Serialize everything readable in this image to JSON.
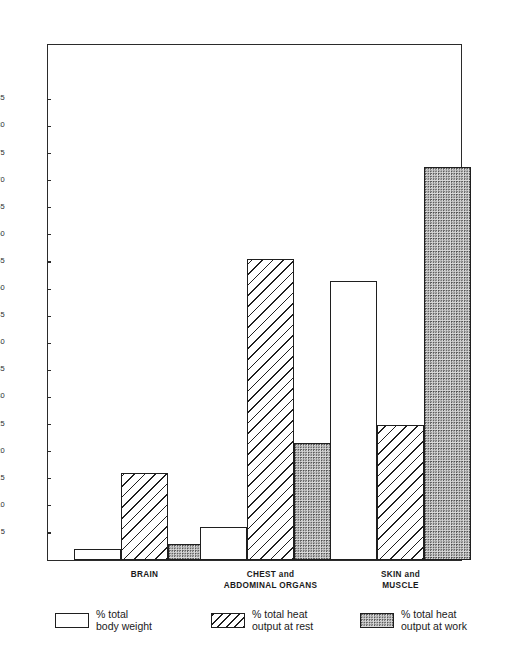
{
  "chart_data": {
    "type": "bar",
    "title": "",
    "subtitle": "",
    "xlabel": "",
    "ylabel": "",
    "grid": false,
    "legend_position": "bottom",
    "ylim": [
      0,
      88
    ],
    "yticks": [
      5,
      10,
      15,
      20,
      25,
      30,
      35,
      40,
      45,
      50,
      55,
      60,
      65,
      70,
      75,
      80,
      85
    ],
    "ytick_labels": [
      "5",
      "10",
      "15",
      "20",
      "25",
      "30",
      "35",
      "40",
      "45",
      "50",
      "55",
      "60",
      "65",
      "70",
      "75",
      "80",
      "85"
    ],
    "categories": [
      "BRAIN",
      "CHEST and\nABDOMINAL ORGANS",
      "SKIN and\nMUSCLE"
    ],
    "series": [
      {
        "name": "% total\nbody weight",
        "pattern": "plain",
        "values": [
          2,
          6,
          51.5
        ]
      },
      {
        "name": "% total heat\noutput at rest",
        "pattern": "hatched",
        "values": [
          16,
          55.5,
          25
        ]
      },
      {
        "name": "% total heat\noutput at work",
        "pattern": "dotted",
        "values": [
          3,
          21.5,
          72.5
        ]
      }
    ]
  },
  "axis": {
    "ticks": [
      {
        "value": 85,
        "label": "85"
      },
      {
        "value": 80,
        "label": "80"
      },
      {
        "value": 75,
        "label": "75"
      },
      {
        "value": 70,
        "label": "70"
      },
      {
        "value": 65,
        "label": "65"
      },
      {
        "value": 60,
        "label": "60"
      },
      {
        "value": 55,
        "label": "55"
      },
      {
        "value": 50,
        "label": "50"
      },
      {
        "value": 45,
        "label": "45"
      },
      {
        "value": 40,
        "label": "40"
      },
      {
        "value": 35,
        "label": "35"
      },
      {
        "value": 30,
        "label": "30"
      },
      {
        "value": 25,
        "label": "25"
      },
      {
        "value": 20,
        "label": "20"
      },
      {
        "value": 15,
        "label": "15"
      },
      {
        "value": 10,
        "label": "10"
      },
      {
        "value": 5,
        "label": "5"
      }
    ]
  },
  "groups": [
    {
      "id": "brain",
      "label": "BRAIN"
    },
    {
      "id": "chest",
      "label": "CHEST and\nABDOMINAL ORGANS"
    },
    {
      "id": "skin",
      "label": "SKIN and\nMUSCLE"
    }
  ],
  "legend": {
    "items": [
      {
        "id": "body-weight",
        "pattern": "plain",
        "label": "% total\nbody weight"
      },
      {
        "id": "heat-rest",
        "pattern": "hatched",
        "label": "% total heat\noutput at rest"
      },
      {
        "id": "heat-work",
        "pattern": "dotted",
        "label": "% total heat\noutput at work"
      }
    ]
  },
  "colors": {
    "axis": "#2b2b2b",
    "bar_outline": "#1f1f1f",
    "plain_fill": "#ffffff",
    "dotted_fill": "#d9d9d9",
    "text": "#1a1a1a",
    "background": "#ffffff"
  }
}
